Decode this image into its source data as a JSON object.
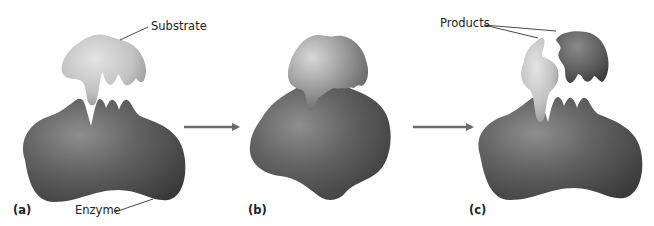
{
  "figure": {
    "panels": [
      {
        "id": "a",
        "label": "(a)",
        "description": "Enzyme with free substrate above active site"
      },
      {
        "id": "b",
        "label": "(b)",
        "description": "Enzyme-substrate complex, enzyme changes shape to fit"
      },
      {
        "id": "c",
        "label": "(c)",
        "description": "Enzyme releases two products"
      }
    ],
    "callouts": {
      "substrate": "Substrate",
      "enzyme": "Enzyme",
      "products": "Products"
    },
    "arrows": [
      {
        "from": "a",
        "to": "b"
      },
      {
        "from": "b",
        "to": "c"
      }
    ],
    "colors": {
      "enzyme_dark": "#3f3f3f",
      "enzyme_mid": "#6a6a6a",
      "enzyme_light": "#9a9a9a",
      "substrate_light": "#d4d4d4",
      "substrate_mid": "#a8a8a8",
      "arrow": "#6b6b6b",
      "text": "#222222",
      "background": "#ffffff"
    }
  }
}
